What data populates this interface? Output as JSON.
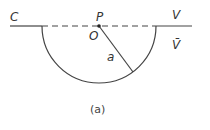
{
  "diagram": {
    "labels": {
      "C": "C",
      "P": "P",
      "O": "O",
      "V": "V",
      "V_bar": "V̄",
      "radius": "a"
    },
    "caption": "(a)",
    "colors": {
      "line": "#444444",
      "text": "#333333"
    }
  }
}
